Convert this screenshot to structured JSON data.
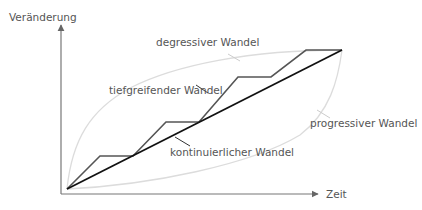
{
  "diagram": {
    "y_axis_label": "Veränderung",
    "x_axis_label": "Zeit",
    "curves": {
      "degressive": {
        "label": "degressiver Wandel",
        "color": "#d9d9d9"
      },
      "progressive": {
        "label": "progressiver Wandel",
        "color": "#d9d9d9"
      },
      "deep": {
        "label": "tiefgreifender Wandel",
        "color": "#555555"
      },
      "continuous": {
        "label": "kontinuierlicher Wandel",
        "color": "#111111"
      }
    },
    "colors": {
      "axis": "#777777",
      "text": "#555555",
      "background": "#ffffff"
    }
  }
}
